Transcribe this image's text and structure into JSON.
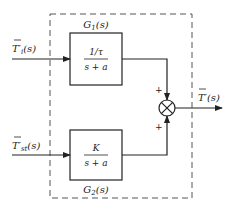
{
  "diagram": {
    "type": "block-diagram",
    "inputs": [
      {
        "id": "in1",
        "label": "T'_i(s)",
        "base": "T",
        "prime": "′",
        "sub": "i",
        "arg": "(s)"
      },
      {
        "id": "in2",
        "label": "T'_st(s)",
        "base": "T",
        "prime": "′",
        "sub": "st",
        "arg": "(s)"
      }
    ],
    "output": {
      "label": "T'(s)",
      "base": "T",
      "prime": "′",
      "arg": "(s)"
    },
    "blocks": [
      {
        "id": "G1",
        "name": "G",
        "sub": "1",
        "arg": "(s)",
        "numerator": "1/τ",
        "denominator": "s + a"
      },
      {
        "id": "G2",
        "name": "G",
        "sub": "2",
        "arg": "(s)",
        "numerator": "K",
        "denominator": "s + a"
      }
    ],
    "summing_junction": {
      "signs": [
        "+",
        "+"
      ]
    },
    "boundary": "dashed"
  }
}
